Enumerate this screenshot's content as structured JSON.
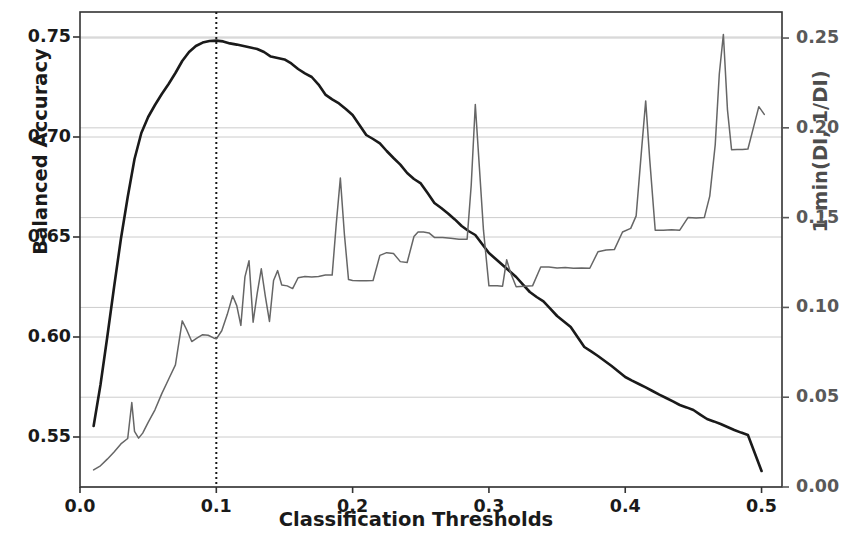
{
  "chart_data": {
    "type": "line",
    "title": "",
    "xlabel": "Classification Thresholds",
    "ylabel": "Balanced Accuracy",
    "ylabel_right": "1-min(DI, 1/DI)",
    "xlim": [
      0.0,
      0.515
    ],
    "ylim_left": [
      0.525,
      0.7625
    ],
    "ylim_right": [
      0.0,
      0.2645
    ],
    "xticks": [
      "0.0",
      "0.1",
      "0.2",
      "0.3",
      "0.4",
      "0.5"
    ],
    "xtick_values": [
      0.0,
      0.1,
      0.2,
      0.3,
      0.4,
      0.5
    ],
    "yticks_left": [
      "0.55",
      "0.60",
      "0.65",
      "0.70",
      "0.75"
    ],
    "ytick_values_left": [
      0.55,
      0.6,
      0.65,
      0.7,
      0.75
    ],
    "yticks_right": [
      "0.00",
      "0.05",
      "0.10",
      "0.15",
      "0.20",
      "0.25"
    ],
    "ytick_values_right": [
      0.0,
      0.05,
      0.1,
      0.15,
      0.2,
      0.25
    ],
    "grid": true,
    "grid_color": "#cccccc",
    "legend_position": "none",
    "annotations": [
      {
        "type": "vline",
        "x": 0.1,
        "style": "dotted",
        "color": "#1a1a1a",
        "label": "0.1"
      }
    ],
    "series": [
      {
        "name": "Balanced Accuracy",
        "axis": "left",
        "color": "#1a1a1a",
        "linewidth": 2.6,
        "x": [
          0.01,
          0.015,
          0.02,
          0.025,
          0.03,
          0.035,
          0.04,
          0.045,
          0.05,
          0.055,
          0.06,
          0.065,
          0.07,
          0.075,
          0.08,
          0.085,
          0.09,
          0.095,
          0.1,
          0.105,
          0.11,
          0.115,
          0.12,
          0.125,
          0.13,
          0.135,
          0.14,
          0.145,
          0.15,
          0.155,
          0.16,
          0.165,
          0.17,
          0.175,
          0.18,
          0.185,
          0.19,
          0.195,
          0.2,
          0.205,
          0.21,
          0.215,
          0.22,
          0.225,
          0.23,
          0.235,
          0.24,
          0.245,
          0.25,
          0.255,
          0.26,
          0.265,
          0.27,
          0.275,
          0.28,
          0.285,
          0.29,
          0.295,
          0.3,
          0.305,
          0.31,
          0.315,
          0.32,
          0.325,
          0.33,
          0.335,
          0.34,
          0.345,
          0.35,
          0.355,
          0.36,
          0.365,
          0.37,
          0.375,
          0.38,
          0.385,
          0.39,
          0.395,
          0.4,
          0.405,
          0.41,
          0.415,
          0.42,
          0.425,
          0.43,
          0.435,
          0.44,
          0.445,
          0.45,
          0.455,
          0.46,
          0.465,
          0.47,
          0.475,
          0.48,
          0.485,
          0.49,
          0.495,
          0.5
        ],
        "y": [
          0.5555,
          0.576,
          0.6,
          0.625,
          0.649,
          0.67,
          0.689,
          0.702,
          0.71,
          0.716,
          0.7215,
          0.7265,
          0.732,
          0.738,
          0.7425,
          0.7455,
          0.7472,
          0.748,
          0.7482,
          0.7478,
          0.7468,
          0.7462,
          0.7455,
          0.7448,
          0.744,
          0.7425,
          0.7402,
          0.7395,
          0.7388,
          0.7368,
          0.734,
          0.7318,
          0.73,
          0.7262,
          0.7212,
          0.7188,
          0.7168,
          0.714,
          0.711,
          0.706,
          0.701,
          0.699,
          0.6968,
          0.693,
          0.6895,
          0.6862,
          0.682,
          0.679,
          0.6768,
          0.672,
          0.667,
          0.6645,
          0.6618,
          0.6588,
          0.6555,
          0.653,
          0.651,
          0.6465,
          0.642,
          0.639,
          0.636,
          0.633,
          0.63,
          0.6262,
          0.6225,
          0.62,
          0.6178,
          0.6142,
          0.6105,
          0.6078,
          0.605,
          0.6,
          0.595,
          0.5928,
          0.5905,
          0.588,
          0.5855,
          0.5828,
          0.58,
          0.5782,
          0.5765,
          0.5748,
          0.573,
          0.5712,
          0.5695,
          0.5678,
          0.566,
          0.5648,
          0.5635,
          0.5612,
          0.559,
          0.5578,
          0.5565,
          0.555,
          0.5535,
          0.5522,
          0.551,
          0.542,
          0.533
        ]
      },
      {
        "name": "1-min(DI, 1/DI)",
        "axis": "right",
        "color": "#666666",
        "linewidth": 1.5,
        "x": [
          0.01,
          0.015,
          0.02,
          0.025,
          0.03,
          0.035,
          0.038,
          0.04,
          0.043,
          0.046,
          0.05,
          0.055,
          0.06,
          0.065,
          0.07,
          0.075,
          0.078,
          0.082,
          0.086,
          0.09,
          0.094,
          0.098,
          0.1,
          0.104,
          0.108,
          0.112,
          0.115,
          0.118,
          0.121,
          0.124,
          0.127,
          0.13,
          0.133,
          0.136,
          0.139,
          0.142,
          0.145,
          0.148,
          0.152,
          0.156,
          0.16,
          0.165,
          0.17,
          0.175,
          0.18,
          0.185,
          0.188,
          0.191,
          0.194,
          0.197,
          0.2,
          0.205,
          0.21,
          0.215,
          0.22,
          0.225,
          0.23,
          0.235,
          0.24,
          0.245,
          0.248,
          0.252,
          0.256,
          0.26,
          0.266,
          0.272,
          0.278,
          0.284,
          0.287,
          0.29,
          0.293,
          0.296,
          0.3,
          0.306,
          0.31,
          0.313,
          0.316,
          0.32,
          0.326,
          0.332,
          0.338,
          0.344,
          0.35,
          0.356,
          0.362,
          0.368,
          0.374,
          0.38,
          0.386,
          0.392,
          0.398,
          0.404,
          0.408,
          0.412,
          0.415,
          0.418,
          0.422,
          0.428,
          0.434,
          0.44,
          0.446,
          0.452,
          0.458,
          0.462,
          0.466,
          0.469,
          0.472,
          0.475,
          0.478,
          0.482,
          0.486,
          0.49,
          0.494,
          0.498,
          0.502
        ],
        "y": [
          0.0095,
          0.0118,
          0.0155,
          0.0195,
          0.024,
          0.027,
          0.047,
          0.031,
          0.0272,
          0.03,
          0.036,
          0.043,
          0.052,
          0.06,
          0.068,
          0.0925,
          0.088,
          0.081,
          0.083,
          0.0848,
          0.0845,
          0.083,
          0.0825,
          0.087,
          0.096,
          0.1065,
          0.101,
          0.09,
          0.117,
          0.126,
          0.0918,
          0.1078,
          0.1215,
          0.106,
          0.0922,
          0.115,
          0.1205,
          0.1125,
          0.112,
          0.1105,
          0.1165,
          0.1172,
          0.117,
          0.1172,
          0.118,
          0.118,
          0.1465,
          0.172,
          0.1405,
          0.1155,
          0.115,
          0.1148,
          0.1148,
          0.115,
          0.129,
          0.1305,
          0.13,
          0.1255,
          0.125,
          0.1395,
          0.142,
          0.142,
          0.1415,
          0.139,
          0.139,
          0.1385,
          0.138,
          0.138,
          0.168,
          0.213,
          0.178,
          0.143,
          0.112,
          0.112,
          0.1118,
          0.1265,
          0.119,
          0.1115,
          0.1118,
          0.112,
          0.1225,
          0.1225,
          0.122,
          0.1222,
          0.1218,
          0.122,
          0.1218,
          0.131,
          0.132,
          0.1322,
          0.142,
          0.144,
          0.151,
          0.188,
          0.215,
          0.182,
          0.143,
          0.143,
          0.1432,
          0.143,
          0.15,
          0.1498,
          0.15,
          0.162,
          0.1905,
          0.23,
          0.252,
          0.21,
          0.1878,
          0.188,
          0.188,
          0.1882,
          0.2,
          0.2118,
          0.2075
        ]
      }
    ]
  },
  "axes": {
    "left_title": "Balanced Accuracy",
    "right_title": "1-min(DI, 1/DI)",
    "bottom_title": "Classification Thresholds"
  },
  "colors": {
    "accuracy_line": "#1a1a1a",
    "disparate_impact_line": "#666666",
    "grid": "#cccccc",
    "frame": "#333333",
    "background": "#ffffff"
  }
}
